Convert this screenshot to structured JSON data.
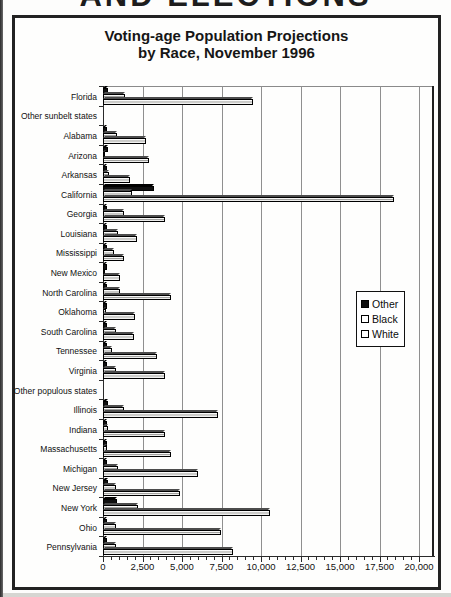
{
  "page": {
    "clipped_header_text": "AND ELECTIONS"
  },
  "chart": {
    "title_line1": "Voting-age Population Projections",
    "title_line2": "by Race, November 1996"
  },
  "chart_data": {
    "type": "bar",
    "orientation": "horizontal",
    "title": "Voting-age Population Projections by Race, November 1996",
    "categories": [
      "Florida",
      "Other sunbelt states",
      "Alabama",
      "Arizona",
      "Arkansas",
      "California",
      "Georgia",
      "Louisiana",
      "Mississippi",
      "New Mexico",
      "North Carolina",
      "Oklahoma",
      "South Carolina",
      "Tennessee",
      "Virginia",
      "Other populous states",
      "Illinois",
      "Indiana",
      "Massachusetts",
      "Michigan",
      "New Jersey",
      "New York",
      "Ohio",
      "Pennsylvania"
    ],
    "series": [
      {
        "name": "Other",
        "color": "#101010",
        "values": [
          300,
          null,
          100,
          300,
          100,
          3200,
          150,
          150,
          50,
          200,
          150,
          200,
          50,
          50,
          250,
          null,
          300,
          50,
          200,
          150,
          300,
          900,
          150,
          150
        ]
      },
      {
        "name": "Black",
        "color": "#ffffff",
        "values": [
          1400,
          null,
          900,
          150,
          400,
          1850,
          1350,
          950,
          700,
          50,
          1100,
          200,
          800,
          550,
          850,
          null,
          1300,
          300,
          270,
          950,
          800,
          2200,
          850,
          800
        ]
      },
      {
        "name": "White",
        "color": "#ffffff",
        "values": [
          9500,
          null,
          2700,
          2900,
          1700,
          18400,
          3950,
          2150,
          1300,
          1100,
          4300,
          2000,
          1950,
          3400,
          3950,
          null,
          7300,
          3950,
          4300,
          6000,
          4900,
          10600,
          7450,
          8200
        ]
      }
    ],
    "xlim": [
      0,
      20000
    ],
    "x_ticks": [
      "0",
      "2,500",
      "5,000",
      "7,500",
      "10,000",
      "12,500",
      "15,000",
      "17,500",
      "20,000"
    ],
    "x_minor_tick_step": 500,
    "grid": true,
    "legend_position": "right-inside",
    "bar_order_top_to_bottom": [
      "Other",
      "Black",
      "White"
    ],
    "note_blank_rows": [
      "Other sunbelt states",
      "Other populous states"
    ]
  }
}
